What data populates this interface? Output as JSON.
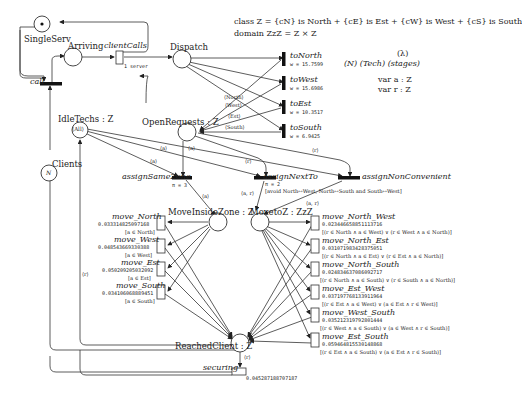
{
  "declarations": {
    "class_line": "class Z = {cN} is North + {cE} is Est + {cW} is West + {cS} is South",
    "domain_line": "domain ZzZ = Z × Z",
    "lambda": "(λ)",
    "params": "(N)  (Tech)  (stages)",
    "var_a": "var a : Z",
    "var_r": "var r : Z"
  },
  "places": {
    "single_serv": {
      "name": "SingleServ",
      "marking": "•"
    },
    "arriving": {
      "name": "Arriving"
    },
    "dispatch": {
      "name": "Dispatch"
    },
    "open_requests": {
      "name": "OpenRequests : Z"
    },
    "idle_techs": {
      "name": "IdleTechs : Z",
      "marking": "⟨All⟩"
    },
    "clients": {
      "name": "Clients",
      "marking": "N"
    },
    "move_inside_zone": {
      "name": "MoveInsideZone : Z"
    },
    "move_to_z": {
      "name": "MovetoZ : ZzZ"
    },
    "reached_client": {
      "name": "ReachedClient : Z"
    }
  },
  "transitions": {
    "call": {
      "name": "call"
    },
    "client_calls": {
      "name": "clientCalls",
      "rate": "λ",
      "server": "1 server"
    },
    "to_north": {
      "name": "toNorth",
      "weight": "w = 15.7599"
    },
    "to_west": {
      "name": "toWest",
      "weight": "w = 15.6986"
    },
    "to_est": {
      "name": "toEst",
      "weight": "w = 10.3517"
    },
    "to_south": {
      "name": "toSouth",
      "weight": "w = 6.9425"
    },
    "assign_same_zone": {
      "name": "assignSameZone",
      "priority": "π = 3"
    },
    "assign_next_to": {
      "name": "assignNextTo",
      "priority": "π = 2",
      "guard": "[avoid North↔West, North↔South and South↔West]"
    },
    "assign_non_convenient": {
      "name": "assignNonConvenient"
    },
    "securing": {
      "name": "securing",
      "rate": "0.045287188707187"
    },
    "move_inside": [
      {
        "name": "move_North",
        "rate": "0.033314825097168",
        "guard": "[a ∈ North]"
      },
      {
        "name": "move_West",
        "rate": "0.048543669330388",
        "guard": "[a ∈ West]"
      },
      {
        "name": "move_Est",
        "rate": "0.050209205032092",
        "guard": "[a ∈ Est]"
      },
      {
        "name": "move_South",
        "rate": "0.034106068889451",
        "guard": "[a ∈ South]"
      }
    ],
    "move_between": [
      {
        "name": "move_North_West",
        "rate": "0.023446658851113716",
        "guard": "[(r ∈ North ∧ a ∈ West) ∨ (r ∈ West ∧ a ∈ North)]"
      },
      {
        "name": "move_North_Est",
        "rate": "0.031071983428375051",
        "guard": "[(r ∈ North ∧ a ∈ Est) ∨ (r ∈ Est ∧ a ∈ North)]"
      },
      {
        "name": "move_North_South",
        "rate": "0.024834637086092717",
        "guard": "[(r ∈ North ∧ a ∈ South) ∨ (r ∈ South ∧ a ∈ North)]"
      },
      {
        "name": "move_Est_West",
        "rate": "0.037197768133911964",
        "guard": "[(r ∈ Est ∧ a ∈ West) ∨ (a ∈ Est ∧ r ∈ West)]"
      },
      {
        "name": "move_West_South",
        "rate": "0.035212319792801444",
        "guard": "[(r ∈ West ∧ a ∈ South) ∨ (a ∈ West ∧ r ∈ South)]"
      },
      {
        "name": "move_Est_South",
        "rate": "0.059464815530148868",
        "guard": "[(r ∈ Est ∧ a ∈ South) ∨ (a ∈ Est ∧ r ∈ South)]"
      }
    ]
  },
  "arc_labels": {
    "north": "⟨North⟩",
    "west": "⟨West⟩",
    "est": "⟨Est⟩",
    "south": "⟨South⟩",
    "a": "⟨a⟩",
    "r": "⟨r⟩",
    "ar": "⟨a, r⟩"
  }
}
